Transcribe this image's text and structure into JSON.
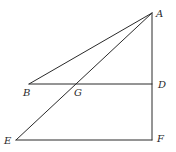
{
  "diagram": {
    "type": "geometry",
    "points": {
      "A": {
        "x": 152,
        "y": 13
      },
      "B": {
        "x": 29,
        "y": 84
      },
      "G": {
        "x": 77,
        "y": 84
      },
      "D": {
        "x": 152,
        "y": 84
      },
      "E": {
        "x": 16,
        "y": 140
      },
      "F": {
        "x": 152,
        "y": 140
      }
    },
    "segments": [
      {
        "id": "AB",
        "from": "A",
        "to": "B"
      },
      {
        "id": "AE",
        "from": "A",
        "to": "E"
      },
      {
        "id": "BD",
        "from": "B",
        "to": "D"
      },
      {
        "id": "EF",
        "from": "E",
        "to": "F"
      },
      {
        "id": "AF",
        "from": "A",
        "to": "F"
      }
    ],
    "labels": [
      {
        "id": "A",
        "text": "A",
        "x": 156,
        "y": 17
      },
      {
        "id": "B",
        "text": "B",
        "x": 23,
        "y": 96
      },
      {
        "id": "G",
        "text": "G",
        "x": 74,
        "y": 96
      },
      {
        "id": "D",
        "text": "D",
        "x": 158,
        "y": 88
      },
      {
        "id": "E",
        "text": "E",
        "x": 4,
        "y": 144
      },
      {
        "id": "F",
        "text": "F",
        "x": 157,
        "y": 142
      }
    ],
    "stroke_color": "#2a2a2a",
    "background": "#ffffff"
  }
}
